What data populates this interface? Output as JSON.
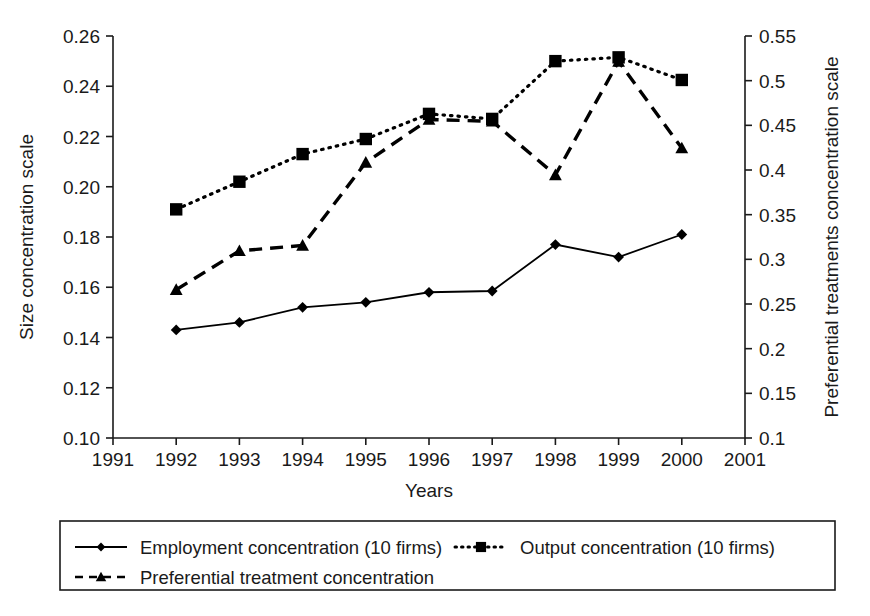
{
  "chart_data": {
    "type": "line",
    "title": "",
    "xlabel": "Years",
    "ylabel": "Size concentration scale",
    "y2label": "Preferential treatments concentration scale",
    "grid": false,
    "legend_position": "bottom",
    "x": [
      1992,
      1993,
      1994,
      1995,
      1996,
      1997,
      1998,
      1999,
      2000
    ],
    "xtick_labels": [
      "1991",
      "1992",
      "1993",
      "1994",
      "1995",
      "1996",
      "1997",
      "1998",
      "1999",
      "2000",
      "2001"
    ],
    "xlim": [
      1991,
      2001
    ],
    "ylim": [
      0.1,
      0.26
    ],
    "ytick_labels": [
      "0.26",
      "0.24",
      "0.22",
      "0.20",
      "0.18",
      "0.16",
      "0.14",
      "0.12",
      "0.10"
    ],
    "y2lim": [
      0.1,
      0.55
    ],
    "y2tick_labels": [
      "0.55",
      "0.5",
      "0.45",
      "0.4",
      "0.35",
      "0.3",
      "0.25",
      "0.2",
      "0.15",
      "0.1"
    ],
    "series": [
      {
        "name": "Employment concentration (10 firms)",
        "axis": "left",
        "marker": "diamond",
        "linestyle": "solid",
        "values": [
          0.143,
          0.146,
          0.152,
          0.154,
          0.158,
          0.1585,
          0.177,
          0.172,
          0.181
        ]
      },
      {
        "name": "Output concentration (10 firms)",
        "axis": "left",
        "marker": "square",
        "linestyle": "dotted",
        "values": [
          0.191,
          0.202,
          0.213,
          0.219,
          0.229,
          0.227,
          0.25,
          0.2515,
          0.2425
        ]
      },
      {
        "name": "Preferential treatment concentration",
        "axis": "right",
        "marker": "triangle",
        "linestyle": "dashed",
        "values": [
          0.266,
          0.3095,
          0.3155,
          0.4085,
          0.4565,
          0.4545,
          0.3945,
          0.5215,
          0.4245
        ]
      }
    ]
  },
  "legend": {
    "entries": [
      {
        "label": "Employment concentration (10 firms)",
        "marker": "diamond",
        "linestyle": "solid"
      },
      {
        "label": "Output concentration (10 firms)",
        "marker": "square",
        "linestyle": "dotted"
      },
      {
        "label": "Preferential treatment concentration",
        "marker": "triangle",
        "linestyle": "dashed"
      }
    ]
  }
}
